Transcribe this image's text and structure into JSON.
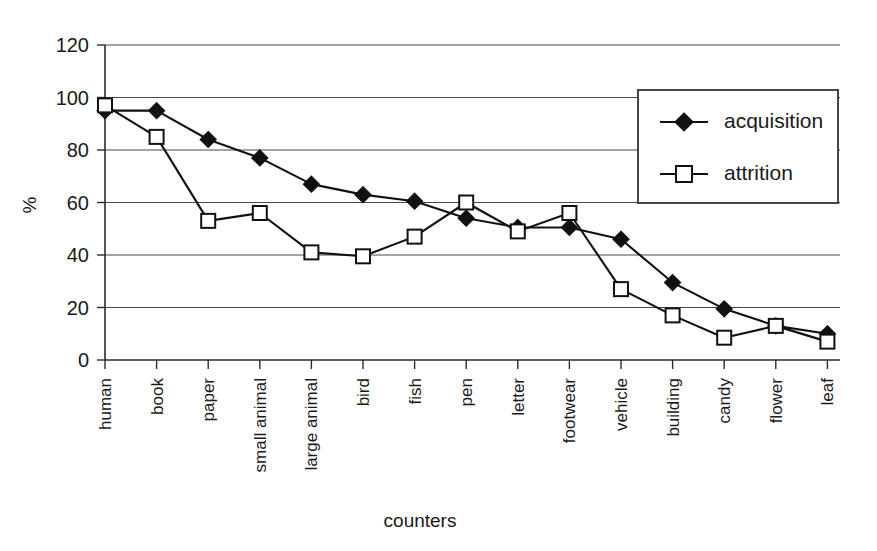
{
  "chart_data": {
    "type": "line",
    "title": "",
    "xlabel": "counters",
    "ylabel": "%",
    "ylim": [
      0,
      120
    ],
    "yticks": [
      0,
      20,
      40,
      60,
      80,
      100,
      120
    ],
    "grid": true,
    "legend_position": "top-right",
    "categories": [
      "human",
      "book",
      "paper",
      "small animal",
      "large animal",
      "bird",
      "fish",
      "pen",
      "letter",
      "footwear",
      "vehicle",
      "building",
      "candy",
      "flower",
      "leaf"
    ],
    "series": [
      {
        "name": "acquisition",
        "marker": "filled-diamond",
        "values": [
          95,
          95,
          84,
          77,
          67,
          63,
          60.5,
          54,
          50.5,
          50.5,
          46,
          29.5,
          19.5,
          13,
          10
        ]
      },
      {
        "name": "attrition",
        "marker": "open-square",
        "values": [
          97,
          85,
          53,
          56,
          41,
          39.5,
          47,
          60,
          49,
          56,
          27,
          17,
          8.5,
          13,
          7
        ]
      }
    ]
  },
  "legend": {
    "entries": [
      {
        "label": "acquisition"
      },
      {
        "label": "attrition"
      }
    ]
  },
  "colors": {
    "ink": "#111111",
    "grid": "#4a4a4a",
    "background": "#ffffff"
  }
}
